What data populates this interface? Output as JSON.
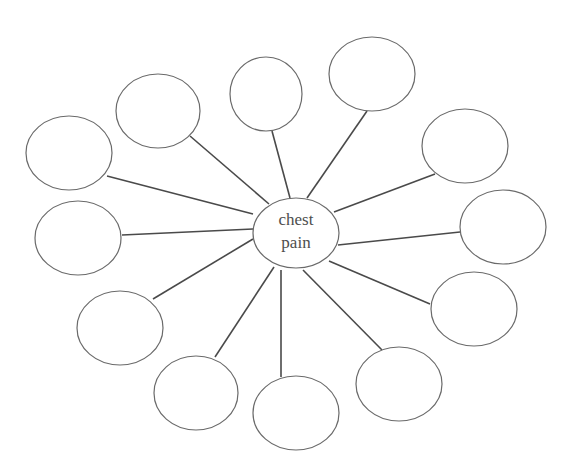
{
  "diagram": {
    "type": "spider-map",
    "center": {
      "label_lines": [
        "chest",
        "pain"
      ],
      "cx": 296,
      "cy": 233,
      "rx": 43,
      "ry": 35
    },
    "nodes": [
      {
        "id": "node-1",
        "label": "",
        "cx": 69,
        "cy": 153,
        "rx": 43,
        "ry": 37,
        "line": [
          107,
          176,
          253,
          214
        ]
      },
      {
        "id": "node-2",
        "label": "",
        "cx": 158,
        "cy": 111,
        "rx": 42,
        "ry": 37,
        "line": [
          190,
          136,
          269,
          204
        ]
      },
      {
        "id": "node-3",
        "label": "",
        "cx": 266,
        "cy": 94,
        "rx": 36,
        "ry": 37,
        "line": [
          272,
          131,
          290,
          198
        ]
      },
      {
        "id": "node-4",
        "label": "",
        "cx": 372,
        "cy": 74,
        "rx": 43,
        "ry": 37,
        "line": [
          367,
          111,
          307,
          198
        ]
      },
      {
        "id": "node-5",
        "label": "",
        "cx": 465,
        "cy": 146,
        "rx": 43,
        "ry": 37,
        "line": [
          435,
          174,
          334,
          212
        ]
      },
      {
        "id": "node-6",
        "label": "",
        "cx": 503,
        "cy": 227,
        "rx": 43,
        "ry": 37,
        "line": [
          460,
          232,
          338,
          245
        ]
      },
      {
        "id": "node-7",
        "label": "",
        "cx": 474,
        "cy": 309,
        "rx": 43,
        "ry": 37,
        "line": [
          430,
          304,
          329,
          261
        ]
      },
      {
        "id": "node-8",
        "label": "",
        "cx": 399,
        "cy": 384,
        "rx": 43,
        "ry": 37,
        "line": [
          382,
          350,
          303,
          270
        ]
      },
      {
        "id": "node-9",
        "label": "",
        "cx": 296,
        "cy": 413,
        "rx": 43,
        "ry": 37,
        "line": [
          281,
          377,
          281,
          270
        ]
      },
      {
        "id": "node-10",
        "label": "",
        "cx": 196,
        "cy": 393,
        "rx": 42,
        "ry": 37,
        "line": [
          215,
          357,
          274,
          267
        ]
      },
      {
        "id": "node-11",
        "label": "",
        "cx": 120,
        "cy": 328,
        "rx": 43,
        "ry": 37,
        "line": [
          153,
          299,
          253,
          239
        ]
      },
      {
        "id": "node-12",
        "label": "",
        "cx": 78,
        "cy": 238,
        "rx": 43,
        "ry": 37,
        "line": [
          122,
          235,
          253,
          229
        ]
      }
    ]
  }
}
